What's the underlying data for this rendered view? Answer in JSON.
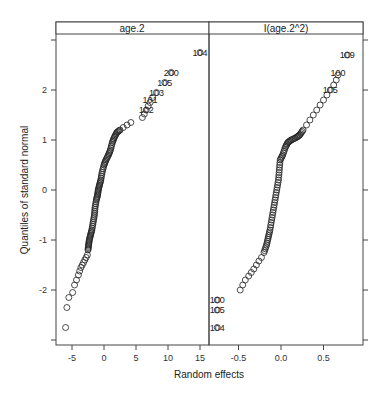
{
  "chart_data": {
    "type": "scatter",
    "subtype": "normal-qq-plot",
    "xlabel": "Random effects",
    "ylabel": "Quantiles of standard normal",
    "grid": false,
    "ylim": [
      -3,
      3
    ],
    "yticks": [
      -2,
      -1,
      0,
      1,
      2
    ],
    "panels": [
      {
        "strip": "age.2",
        "xlim": [
          -6.5,
          16
        ],
        "xticks": [
          -5,
          0,
          5,
          10,
          15
        ],
        "points": [
          [
            -6.0,
            -2.75
          ],
          [
            -5.8,
            -2.35
          ],
          [
            -5.5,
            -2.15
          ],
          [
            -4.9,
            -2.05
          ],
          [
            -4.6,
            -1.9
          ],
          [
            -4.3,
            -1.8
          ],
          [
            -4.0,
            -1.7
          ],
          [
            -3.8,
            -1.62
          ],
          [
            -3.6,
            -1.55
          ],
          [
            -3.4,
            -1.5
          ],
          [
            -3.2,
            -1.45
          ],
          [
            -3.0,
            -1.4
          ],
          [
            -2.8,
            -1.35
          ],
          [
            -2.6,
            -1.3
          ],
          [
            -2.5,
            -1.2
          ],
          [
            -2.4,
            -1.1
          ],
          [
            -2.3,
            -1.0
          ],
          [
            -2.1,
            -0.9
          ],
          [
            -1.9,
            -0.8
          ],
          [
            -1.7,
            -0.65
          ],
          [
            -1.5,
            -0.5
          ],
          [
            -1.4,
            -0.35
          ],
          [
            -1.2,
            -0.2
          ],
          [
            -1.0,
            -0.1
          ],
          [
            -0.9,
            0.0
          ],
          [
            -0.7,
            0.1
          ],
          [
            -0.5,
            0.2
          ],
          [
            -0.3,
            0.35
          ],
          [
            0.0,
            0.5
          ],
          [
            0.3,
            0.6
          ],
          [
            0.7,
            0.7
          ],
          [
            1.0,
            0.8
          ],
          [
            1.3,
            0.95
          ],
          [
            1.6,
            1.05
          ],
          [
            2.0,
            1.15
          ],
          [
            2.5,
            1.2
          ],
          [
            3.0,
            1.25
          ],
          [
            3.6,
            1.3
          ],
          [
            4.2,
            1.35
          ],
          [
            6.0,
            1.45
          ],
          [
            6.3,
            1.52
          ],
          [
            6.6,
            1.6
          ],
          [
            6.9,
            1.68
          ],
          [
            7.2,
            1.75
          ],
          [
            7.6,
            1.85
          ],
          [
            8.2,
            1.95
          ],
          [
            9.5,
            2.15
          ],
          [
            10.5,
            2.35
          ],
          [
            15.0,
            2.75
          ]
        ],
        "labeled_points": [
          {
            "label": "104",
            "x": 15.0,
            "y": 2.75
          },
          {
            "label": "200",
            "x": 10.5,
            "y": 2.35
          },
          {
            "label": "105",
            "x": 9.5,
            "y": 2.15
          },
          {
            "label": "103",
            "x": 8.2,
            "y": 1.95
          },
          {
            "label": "101",
            "x": 7.2,
            "y": 1.8
          },
          {
            "label": "102",
            "x": 6.6,
            "y": 1.6
          }
        ]
      },
      {
        "strip": "I(age.2^2)",
        "xlim": [
          -0.85,
          0.95
        ],
        "xticks": [
          -0.5,
          0.0,
          0.5
        ],
        "points": [
          [
            -0.75,
            -2.75
          ],
          [
            -0.75,
            -2.4
          ],
          [
            -0.75,
            -2.2
          ],
          [
            -0.48,
            -2.0
          ],
          [
            -0.45,
            -1.9
          ],
          [
            -0.42,
            -1.8
          ],
          [
            -0.38,
            -1.72
          ],
          [
            -0.35,
            -1.65
          ],
          [
            -0.32,
            -1.58
          ],
          [
            -0.29,
            -1.5
          ],
          [
            -0.26,
            -1.42
          ],
          [
            -0.23,
            -1.35
          ],
          [
            -0.2,
            -1.25
          ],
          [
            -0.17,
            -1.1
          ],
          [
            -0.15,
            -0.95
          ],
          [
            -0.13,
            -0.8
          ],
          [
            -0.11,
            -0.6
          ],
          [
            -0.09,
            -0.4
          ],
          [
            -0.07,
            -0.2
          ],
          [
            -0.05,
            0.0
          ],
          [
            -0.03,
            0.2
          ],
          [
            -0.02,
            0.4
          ],
          [
            -0.01,
            0.6
          ],
          [
            0.02,
            0.7
          ],
          [
            0.05,
            0.85
          ],
          [
            0.08,
            0.95
          ],
          [
            0.12,
            1.0
          ],
          [
            0.18,
            1.05
          ],
          [
            0.22,
            1.1
          ],
          [
            0.26,
            1.2
          ],
          [
            0.3,
            1.3
          ],
          [
            0.34,
            1.4
          ],
          [
            0.38,
            1.5
          ],
          [
            0.42,
            1.6
          ],
          [
            0.46,
            1.7
          ],
          [
            0.5,
            1.8
          ],
          [
            0.54,
            1.9
          ],
          [
            0.58,
            2.0
          ],
          [
            0.62,
            2.1
          ],
          [
            0.65,
            2.2
          ],
          [
            0.67,
            2.3
          ],
          [
            0.78,
            2.7
          ]
        ],
        "labeled_points": [
          {
            "label": "109",
            "x": 0.78,
            "y": 2.7
          },
          {
            "label": "100",
            "x": 0.67,
            "y": 2.35
          },
          {
            "label": "105",
            "x": 0.58,
            "y": 2.0
          },
          {
            "label": "100",
            "x": -0.75,
            "y": -2.2
          },
          {
            "label": "105",
            "x": -0.75,
            "y": -2.4
          },
          {
            "label": "104",
            "x": -0.75,
            "y": -2.75
          }
        ]
      }
    ]
  }
}
